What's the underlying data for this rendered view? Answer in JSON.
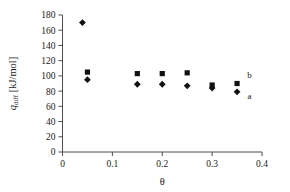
{
  "chart_data": {
    "type": "scatter",
    "title": "",
    "xlabel": "θ",
    "ylabel": "q_diff [kJ/mol]",
    "ylabel_parts": {
      "base": "q",
      "subscript": "diff",
      "units": " [kJ/mol]"
    },
    "xlim": [
      0,
      0.4
    ],
    "ylim": [
      0,
      180
    ],
    "xticks": [
      0,
      0.1,
      0.2,
      0.3,
      0.4
    ],
    "xtick_labels": [
      "0",
      "0.1",
      "0.2",
      "0.3",
      "0.4"
    ],
    "yticks": [
      0,
      20,
      40,
      60,
      80,
      100,
      120,
      140,
      160,
      180
    ],
    "ytick_labels": [
      "0",
      "20",
      "40",
      "60",
      "80",
      "100",
      "120",
      "140",
      "160",
      "180"
    ],
    "grid": false,
    "legend_position": "inline-right",
    "series": [
      {
        "name": "b",
        "marker": "square",
        "color": "#121212",
        "points": [
          {
            "x": 0.05,
            "y": 105
          },
          {
            "x": 0.15,
            "y": 103
          },
          {
            "x": 0.2,
            "y": 103
          },
          {
            "x": 0.25,
            "y": 104
          },
          {
            "x": 0.3,
            "y": 88
          },
          {
            "x": 0.35,
            "y": 90
          }
        ]
      },
      {
        "name": "a",
        "marker": "diamond",
        "color": "#121212",
        "points": [
          {
            "x": 0.04,
            "y": 170
          },
          {
            "x": 0.05,
            "y": 95
          },
          {
            "x": 0.15,
            "y": 89
          },
          {
            "x": 0.2,
            "y": 89
          },
          {
            "x": 0.25,
            "y": 87
          },
          {
            "x": 0.3,
            "y": 84
          },
          {
            "x": 0.35,
            "y": 79
          }
        ]
      }
    ],
    "annotations": [
      {
        "text": "b",
        "x": 0.375,
        "y": 97
      },
      {
        "text": "a",
        "x": 0.375,
        "y": 70
      }
    ]
  }
}
